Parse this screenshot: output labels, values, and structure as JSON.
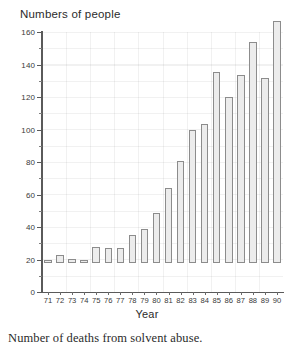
{
  "figure": {
    "y_axis_title": "Numbers of people",
    "x_axis_title": "Year",
    "caption": "Number of deaths from solvent abuse."
  },
  "colors": {
    "bar_fill": "#ececec",
    "bar_edge": "#8c8c8c",
    "axis": "#5a5a5a",
    "grid": "#f0f0f0",
    "text": "#2b2b2b"
  },
  "chart_data": {
    "type": "bar",
    "title": "",
    "xlabel": "Year",
    "ylabel": "Numbers of people",
    "caption": "Number of deaths from solvent abuse.",
    "ylim": [
      0,
      160
    ],
    "ytick_major": [
      0,
      20,
      40,
      60,
      80,
      100,
      120,
      140,
      160
    ],
    "ytick_minor": [
      10,
      30,
      50,
      70,
      90,
      110,
      130,
      150
    ],
    "ytick_labels": [
      "0",
      "20",
      "40",
      "60",
      "80",
      "100",
      "120",
      "140",
      "160"
    ],
    "grid": true,
    "legend": false,
    "categories": [
      "71",
      "72",
      "73",
      "74",
      "75",
      "76",
      "77",
      "78",
      "79",
      "80",
      "81",
      "82",
      "83",
      "84",
      "85",
      "86",
      "87",
      "88",
      "89",
      "90"
    ],
    "values": [
      2,
      5,
      2.5,
      2,
      10,
      9,
      9,
      17,
      21,
      31,
      46,
      63,
      82,
      85.5,
      117.5,
      102,
      116,
      136,
      114,
      149
    ]
  }
}
